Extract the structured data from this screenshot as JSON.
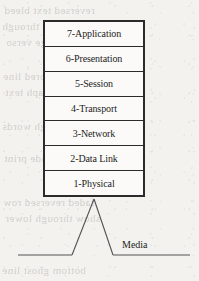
{
  "diagram": {
    "stack": {
      "name": "osi-layer-stack",
      "layers": [
        {
          "number": "7",
          "name": "Application",
          "label": "7-Application"
        },
        {
          "number": "6",
          "name": "Presentation",
          "label": "6-Presentation"
        },
        {
          "number": "5",
          "name": "Session",
          "label": "5-Session"
        },
        {
          "number": "4",
          "name": "Transport",
          "label": "4-Transport"
        },
        {
          "number": "3",
          "name": "Network",
          "label": "3-Network"
        },
        {
          "number": "2",
          "name": "Data Link",
          "label": "2-Data Link"
        },
        {
          "number": "1",
          "name": "Physical",
          "label": "1-Physical"
        }
      ]
    },
    "media": {
      "label": "Media",
      "connector": "inverted-v-peak"
    },
    "colors": {
      "ink": "#1d1d1d",
      "border": "#2b2b2b",
      "line": "#555252",
      "paper": "#f3f2ef",
      "cell": "#fbfaf8",
      "ghost": "rgba(120,118,112,0.30)"
    },
    "background_showthrough": [
      {
        "text": "reversed text bleed",
        "x": 4,
        "y": 4
      },
      {
        "text": "illegible show through",
        "x": 2,
        "y": 20
      },
      {
        "text": "scanned page verso",
        "x": 6,
        "y": 36
      },
      {
        "text": "faint mirrored line",
        "x": 3,
        "y": 70
      },
      {
        "text": "ghost paragraph text",
        "x": 5,
        "y": 86
      },
      {
        "text": "bleed through words",
        "x": 2,
        "y": 120
      },
      {
        "text": "reverse side print",
        "x": 4,
        "y": 152
      },
      {
        "text": "faded reversed row",
        "x": 3,
        "y": 196
      },
      {
        "text": "show through lower",
        "x": 5,
        "y": 212
      },
      {
        "text": "bottom ghost line",
        "x": 2,
        "y": 264
      }
    ]
  }
}
